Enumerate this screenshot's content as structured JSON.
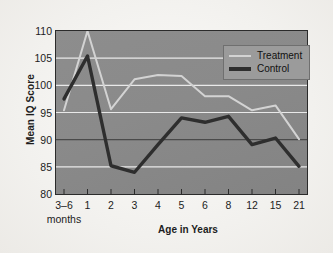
{
  "chart_data": {
    "type": "line",
    "title": "",
    "xlabel": "Age in Years",
    "ylabel": "Mean IQ Score",
    "categories": [
      "3–6",
      "1",
      "2",
      "3",
      "4",
      "5",
      "6",
      "8",
      "12",
      "15",
      "21"
    ],
    "category_note": "months",
    "yticks": [
      "110",
      "105",
      "100",
      "95",
      "90",
      "85",
      "80"
    ],
    "ylim": [
      80,
      110
    ],
    "grid": true,
    "legend_position": "top-right",
    "series": [
      {
        "name": "Treatment",
        "color": "#d3d3d3",
        "values": [
          95.4,
          110.0,
          95.6,
          101.1,
          101.9,
          101.7,
          98.0,
          98.0,
          95.4,
          96.3,
          90.1
        ]
      },
      {
        "name": "Control",
        "color": "#2e2e2e",
        "values": [
          97.5,
          105.4,
          85.2,
          84.0,
          89.1,
          94.0,
          93.2,
          94.3,
          89.1,
          90.3,
          85.1
        ]
      }
    ]
  },
  "legend": {
    "treatment_label": "Treatment",
    "control_label": "Control"
  }
}
